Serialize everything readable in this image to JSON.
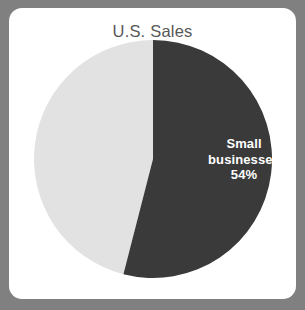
{
  "card": {
    "background_color": "#ffffff",
    "page_background_color": "#808080"
  },
  "chart_data": {
    "type": "pie",
    "title": "U.S. Sales",
    "xlabel": "",
    "ylabel": "",
    "legend_position": "none",
    "grid": false,
    "categories": [
      "Small businesses",
      "Other"
    ],
    "values": [
      54,
      46
    ],
    "colors": [
      "#3a3a3a",
      "#e2e2e2"
    ],
    "start_angle_deg": 0,
    "direction": "clockwise",
    "labels": [
      {
        "series": "Small businesses",
        "line1": "Small",
        "line2": "businesses",
        "line3": "54%",
        "value": 54,
        "value_text": "54%",
        "text_color": "#ffffff"
      }
    ],
    "title_color": "#575757"
  }
}
